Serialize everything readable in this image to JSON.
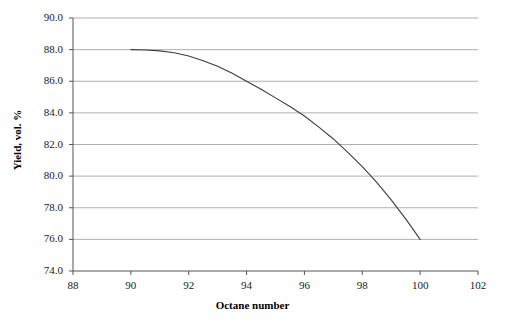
{
  "chart_data": {
    "type": "line",
    "title": "",
    "xlabel": "Octane number",
    "ylabel": "Yield, vol. %",
    "xlim": [
      88,
      102
    ],
    "ylim": [
      74.0,
      90.0
    ],
    "xticks": [
      "88",
      "90",
      "92",
      "94",
      "96",
      "98",
      "100",
      "102"
    ],
    "yticks": [
      "74.0",
      "76.0",
      "78.0",
      "80.0",
      "82.0",
      "84.0",
      "86.0",
      "88.0",
      "90.0"
    ],
    "grid": "horizontal",
    "legend": "none",
    "series": [
      {
        "name": "Yield vs octane number",
        "color": "#3d3d3d",
        "x": [
          90,
          90.5,
          91,
          91.5,
          92,
          92.5,
          93,
          93.5,
          94,
          94.5,
          95,
          95.5,
          96,
          96.5,
          97,
          97.5,
          98,
          98.5,
          99,
          99.5,
          100
        ],
        "y": [
          88.0,
          87.98,
          87.92,
          87.8,
          87.6,
          87.3,
          86.95,
          86.5,
          86.0,
          85.5,
          84.95,
          84.4,
          83.8,
          83.1,
          82.35,
          81.5,
          80.6,
          79.6,
          78.5,
          77.3,
          76.0
        ]
      }
    ]
  },
  "axes": {
    "x_title": "Octane number",
    "y_title": "Yield, vol. %"
  }
}
